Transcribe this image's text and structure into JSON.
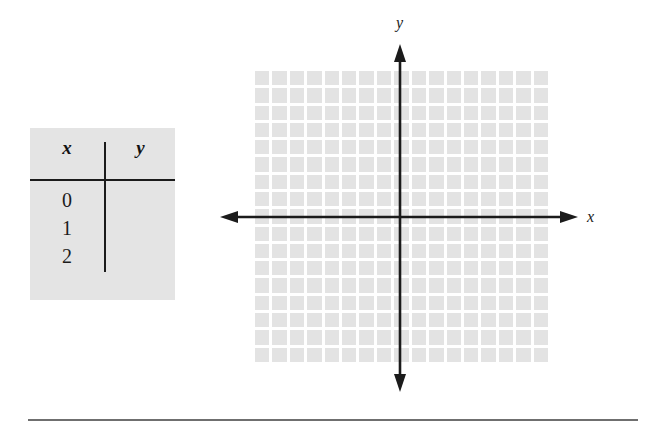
{
  "figure": {
    "name": "coordinate-plane-with-value-table",
    "background_color": "#ffffff"
  },
  "value_table": {
    "headers": {
      "x": "x",
      "y": "y"
    },
    "x_values": [
      "0",
      "1",
      "2"
    ],
    "y_values": [
      "",
      "",
      ""
    ],
    "background_color": "#e4e4e4",
    "rule_color": "#1b1b1b"
  },
  "graph": {
    "grid": {
      "cell_fill_color": "#e3e3e3",
      "gridline_color": "#ffffff",
      "columns": 17,
      "rows": 17
    },
    "axes": {
      "color": "#1b1b1b",
      "x_label": "x",
      "y_label": "y",
      "x_axis_arrows": "both",
      "y_axis_arrows": "both"
    }
  },
  "footer": {
    "rule_color": "#6f6f6f"
  }
}
